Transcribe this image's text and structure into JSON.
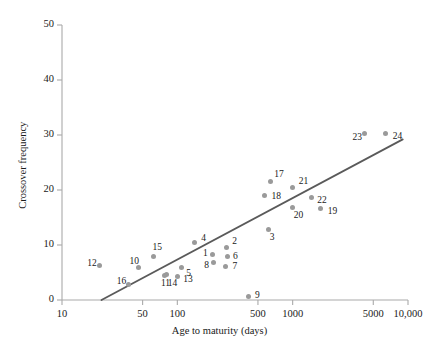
{
  "chart_data": {
    "type": "scatter",
    "title": "",
    "xlabel": "Age to maturity (days)",
    "ylabel": "Crossover frequency",
    "xscale": "log",
    "yscale": "linear",
    "xlim": [
      10,
      10000
    ],
    "ylim": [
      0,
      50
    ],
    "grid": false,
    "legend": null,
    "xticks": [
      {
        "value": 10,
        "label": "10"
      },
      {
        "value": 50,
        "label": "50"
      },
      {
        "value": 100,
        "label": "100"
      },
      {
        "value": 500,
        "label": "500"
      },
      {
        "value": 1000,
        "label": "1000"
      },
      {
        "value": 5000,
        "label": "5000"
      },
      {
        "value": 10000,
        "label": "10,000"
      }
    ],
    "yticks": [
      {
        "value": 0,
        "label": "0"
      },
      {
        "value": 10,
        "label": "10"
      },
      {
        "value": 20,
        "label": "20"
      },
      {
        "value": 30,
        "label": "30"
      },
      {
        "value": 40,
        "label": "40"
      },
      {
        "value": 50,
        "label": "50"
      }
    ],
    "marker_color": "#9a9a9a",
    "line_color": "#5a5a5a",
    "axis_color": "#aaaaaa",
    "trendline": {
      "x_start": 22,
      "y_start": 0,
      "x_end": 9000,
      "y_end": 29.2
    },
    "points": [
      {
        "label": "1",
        "x": 200,
        "y": 8.2,
        "label_dx": -9,
        "label_dy": -1
      },
      {
        "label": "2",
        "x": 265,
        "y": 9.6,
        "label_dx": 6,
        "label_dy": -5
      },
      {
        "label": "3",
        "x": 620,
        "y": 12.8,
        "label_dx": 1,
        "label_dy": 8
      },
      {
        "label": "4",
        "x": 140,
        "y": 10.4,
        "label_dx": 7,
        "label_dy": -4
      },
      {
        "label": "5",
        "x": 108,
        "y": 6.0,
        "label_dx": 5,
        "label_dy": 7
      },
      {
        "label": "6",
        "x": 270,
        "y": 8.0,
        "label_dx": 6,
        "label_dy": 1
      },
      {
        "label": "7",
        "x": 262,
        "y": 6.1,
        "label_dx": 7,
        "label_dy": 1
      },
      {
        "label": "8",
        "x": 205,
        "y": 6.9,
        "label_dx": -9,
        "label_dy": 4
      },
      {
        "label": "9",
        "x": 410,
        "y": 0.6,
        "label_dx": 7,
        "label_dy": -1
      },
      {
        "label": "10",
        "x": 46,
        "y": 6.0,
        "label_dx": -9,
        "label_dy": -5
      },
      {
        "label": "11",
        "x": 78,
        "y": 4.4,
        "label_dx": -4,
        "label_dy": 8
      },
      {
        "label": "12",
        "x": 21,
        "y": 6.3,
        "label_dx": -12,
        "label_dy": -1
      },
      {
        "label": "13",
        "x": 100,
        "y": 4.3,
        "label_dx": 6,
        "label_dy": 4
      },
      {
        "label": "14",
        "x": 81,
        "y": 4.6,
        "label_dx": 1,
        "label_dy": 9
      },
      {
        "label": "15",
        "x": 62,
        "y": 8.0,
        "label_dx": -1,
        "label_dy": -8
      },
      {
        "label": "16",
        "x": 38,
        "y": 2.8,
        "label_dx": -12,
        "label_dy": -3
      },
      {
        "label": "17",
        "x": 640,
        "y": 21.5,
        "label_dx": 4,
        "label_dy": -7
      },
      {
        "label": "18",
        "x": 570,
        "y": 19.0,
        "label_dx": 7,
        "label_dy": 1
      },
      {
        "label": "19",
        "x": 1750,
        "y": 16.7,
        "label_dx": 7,
        "label_dy": 4
      },
      {
        "label": "20",
        "x": 1000,
        "y": 16.8,
        "label_dx": 1,
        "label_dy": 8
      },
      {
        "label": "21",
        "x": 1000,
        "y": 20.5,
        "label_dx": 6,
        "label_dy": -5
      },
      {
        "label": "22",
        "x": 1450,
        "y": 18.6,
        "label_dx": 6,
        "label_dy": 3
      },
      {
        "label": "23",
        "x": 4200,
        "y": 30.3,
        "label_dx": -12,
        "label_dy": 5
      },
      {
        "label": "24",
        "x": 6400,
        "y": 30.2,
        "label_dx": 7,
        "label_dy": 3
      }
    ]
  }
}
